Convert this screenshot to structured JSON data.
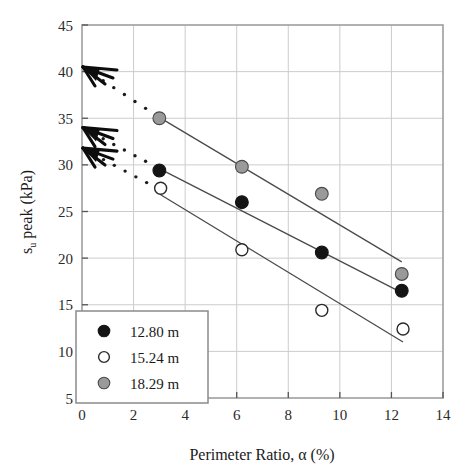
{
  "chart_data": {
    "type": "scatter",
    "title": "",
    "xlabel": "Perimeter Ratio, α (%)",
    "ylabel": "s_u peak (kPa)",
    "ylabel_main": "peak (kPa)",
    "ylabel_sym": "s",
    "ylabel_sub": "u",
    "xlim": [
      0,
      14
    ],
    "ylim": [
      5,
      45
    ],
    "xticks": [
      "0",
      "2",
      "4",
      "6",
      "8",
      "10",
      "12",
      "14"
    ],
    "xtick_values": [
      0,
      2,
      4,
      6,
      8,
      10,
      12,
      14
    ],
    "yticks": [
      "5",
      "10",
      "15",
      "20",
      "25",
      "30",
      "35",
      "40",
      "45"
    ],
    "ytick_values": [
      5,
      10,
      15,
      20,
      25,
      30,
      35,
      40,
      45
    ],
    "grid": true,
    "grid_color": "#c8c8c8",
    "legend_position": "bottom-left",
    "series": [
      {
        "name": "12.80 m",
        "marker": "filled-circle",
        "color": "#141414",
        "edge": "#141414",
        "x": [
          3.0,
          6.2,
          9.3,
          12.4
        ],
        "y": [
          29.4,
          26.0,
          20.6,
          16.5
        ],
        "trendline": {
          "x": [
            3.0,
            12.4
          ],
          "y": [
            29.6,
            16.3
          ]
        },
        "extrapolation": {
          "style": "dotted",
          "x": [
            0.0,
            3.0
          ],
          "y": [
            34.0,
            29.6
          ]
        },
        "axis_arrow_value": 34.0
      },
      {
        "name": "15.24 m",
        "marker": "open-circle",
        "color": "#ffffff",
        "edge": "#2a2a2a",
        "x": [
          3.05,
          6.2,
          9.3,
          12.45
        ],
        "y": [
          27.5,
          20.9,
          14.4,
          12.4
        ],
        "trendline": {
          "x": [
            3.05,
            12.45
          ],
          "y": [
            26.8,
            11.0
          ]
        },
        "extrapolation": {
          "style": "dotted",
          "x": [
            0.0,
            3.05
          ],
          "y": [
            31.8,
            27.3
          ]
        },
        "axis_arrow_value": 31.8
      },
      {
        "name": "18.29 m",
        "marker": "gray-circle",
        "color": "#9a9a9a",
        "edge": "#4a4a4a",
        "x": [
          3.0,
          6.2,
          9.3,
          12.4
        ],
        "y": [
          35.0,
          29.8,
          26.9,
          18.3
        ],
        "trendline": {
          "x": [
            3.0,
            12.4
          ],
          "y": [
            35.1,
            19.6
          ]
        },
        "extrapolation": {
          "style": "dotted",
          "x": [
            0.0,
            3.0
          ],
          "y": [
            40.5,
            35.1
          ]
        },
        "axis_arrow_value": 40.5
      }
    ],
    "axis_arrows": [
      {
        "value": 40.5,
        "label": "arrow-intercept-18-29"
      },
      {
        "value": 34.0,
        "label": "arrow-intercept-12-80"
      },
      {
        "value": 31.8,
        "label": "arrow-intercept-15-24"
      }
    ]
  },
  "legend": {
    "entries": [
      {
        "label": "12.80 m",
        "marker": "filled-circle"
      },
      {
        "label": "15.24 m",
        "marker": "open-circle"
      },
      {
        "label": "18.29 m",
        "marker": "gray-circle"
      }
    ]
  },
  "colors": {
    "frame": "#9e9e9e",
    "grid": "#cccccc",
    "trend": "#4a4a4a",
    "dotted": "#1a1a1a",
    "arrow": "#0d0d0d",
    "text": "#1a1a1a",
    "background": "#ffffff"
  }
}
